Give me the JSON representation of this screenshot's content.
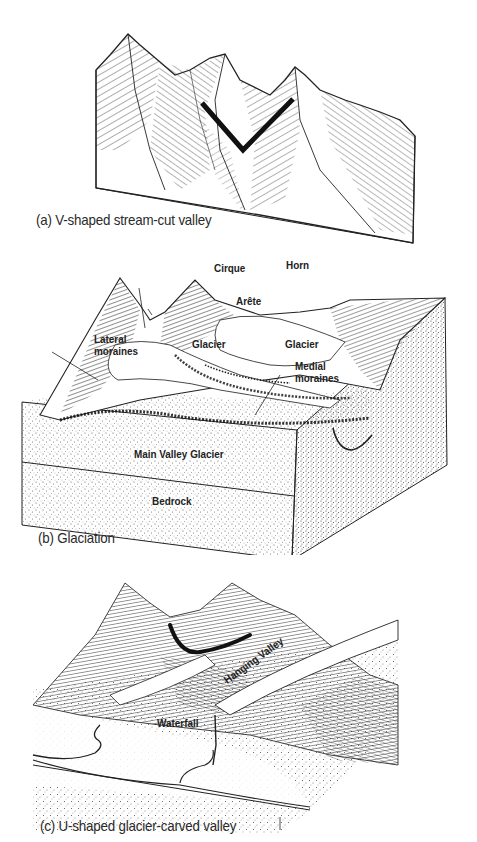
{
  "figure": {
    "panels": [
      {
        "id": "a",
        "caption": "(a) V-shaped stream-cut valley",
        "profile_shape": "V"
      },
      {
        "id": "b",
        "caption": "(b) Glaciation",
        "labels": {
          "cirque": "Cirque",
          "horn": "Horn",
          "arete": "Arête",
          "lateral_moraines_1": "Lateral",
          "lateral_moraines_2": "moraines",
          "glacier_left": "Glacier",
          "glacier_right": "Glacier",
          "medial_moraines_1": "Medial",
          "medial_moraines_2": "moraines",
          "main_valley_glacier": "Main Valley Glacier",
          "bedrock": "Bedrock"
        }
      },
      {
        "id": "c",
        "caption": "(c) U-shaped glacier-carved valley",
        "profile_shape": "U",
        "labels": {
          "hanging_valley": "Hanging Valley",
          "waterfall": "Waterfall"
        }
      }
    ],
    "colors": {
      "ink": "#1a1a1a",
      "paper": "#ffffff",
      "stipple": "#555555"
    }
  }
}
